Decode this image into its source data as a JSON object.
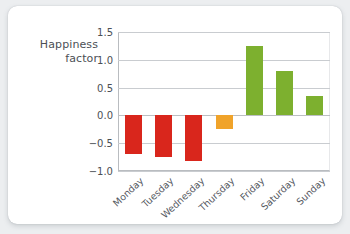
{
  "chart_data": {
    "type": "bar",
    "title": "",
    "subtitle": "",
    "xlabel": "",
    "ylabel": "Happiness\nfactor",
    "ylabel_line1": "Happiness",
    "ylabel_line2": "factor",
    "categories": [
      "Monday",
      "Tuesday",
      "Wednesday",
      "Thursday",
      "Friday",
      "Saturday",
      "Sunday"
    ],
    "values": [
      -0.7,
      -0.75,
      -0.82,
      -0.25,
      1.25,
      0.8,
      0.35
    ],
    "bar_colors": [
      "#d9261c",
      "#d9261c",
      "#d9261c",
      "#f0a32a",
      "#7db02f",
      "#7db02f",
      "#7db02f"
    ],
    "ylim": [
      -1.0,
      1.5
    ],
    "yticks": [
      "1.5",
      "1.0",
      "0.5",
      "0.0",
      "-0.5",
      "-1.0"
    ],
    "ytick_values": [
      1.5,
      1.0,
      0.5,
      0.0,
      -0.5,
      -1.0
    ],
    "grid": true,
    "legend": "none",
    "xtick_rotation": -43
  },
  "colors": {
    "negative": "#d9261c",
    "neutral": "#f0a32a",
    "positive": "#7db02f",
    "grid": "#c9ccd0",
    "axis": "#b9bcc0",
    "text": "#4b4f55",
    "card": "#ffffff",
    "background": "#eceef0"
  }
}
